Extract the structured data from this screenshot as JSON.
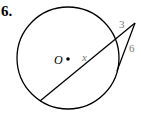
{
  "problem": {
    "number": "6.",
    "center_label": "O",
    "labels": {
      "external_secant": "3",
      "tangent": "6",
      "chord": "x"
    }
  },
  "colors": {
    "line": "#000000",
    "measure_text": "#7a7a7a",
    "background": "#ffffff"
  }
}
